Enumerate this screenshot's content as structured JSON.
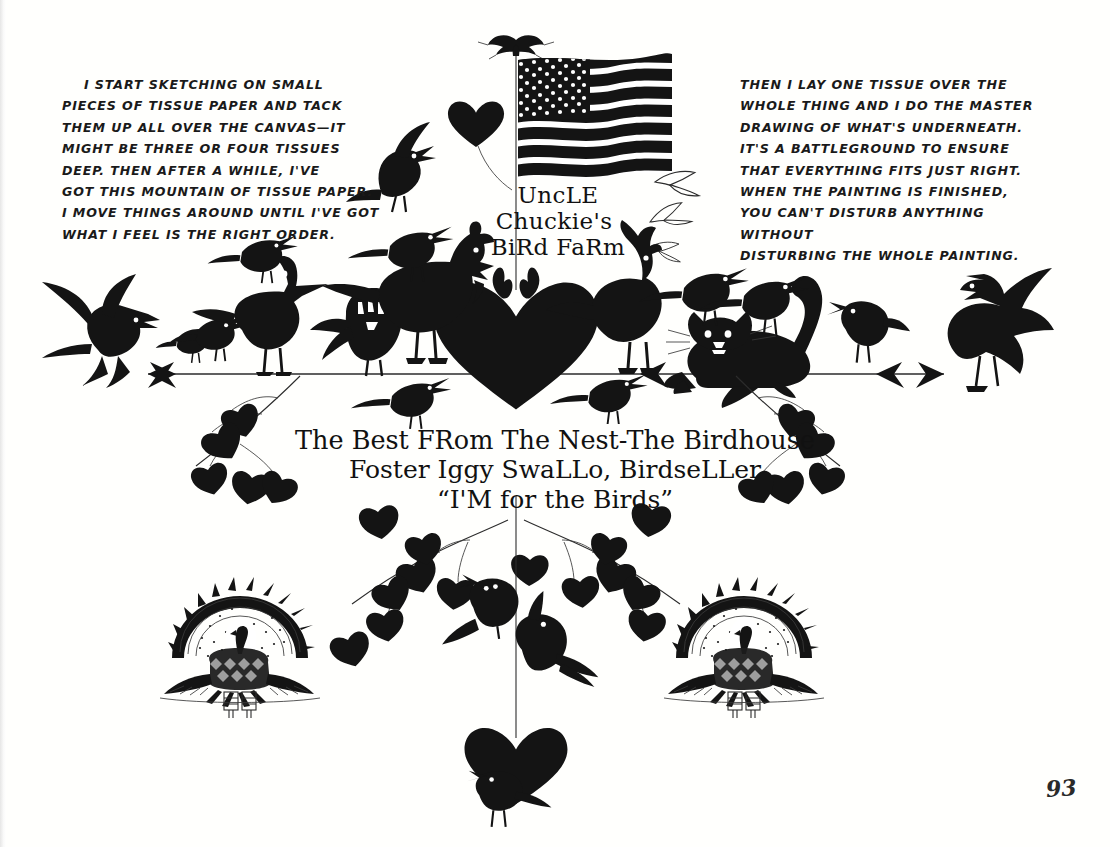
{
  "page": {
    "kind": "illustrated-book-page",
    "background_color": "#ffffff",
    "ink_color": "#141414",
    "page_number": "93"
  },
  "notes": {
    "left": "I START SKETCHING ON SMALL\nPIECES OF TISSUE PAPER AND TACK\nTHEM UP ALL OVER THE CANVAS—IT\nMIGHT BE THREE OR FOUR TISSUES\nDEEP. THEN AFTER A WHILE, I'VE\nGOT THIS MOUNTAIN OF TISSUE PAPER.\nI MOVE THINGS AROUND UNTIL I'VE GOT\nWHAT I FEEL IS THE RIGHT ORDER.",
    "right": "THEN I LAY ONE TISSUE OVER THE\nWHOLE THING AND I DO THE MASTER\nDRAWING OF WHAT'S UNDERNEATH.\nIT'S A BATTLEGROUND TO ENSURE\nTHAT EVERYTHING FITS JUST RIGHT.\nWHEN THE PAINTING IS FINISHED,\nYOU CAN'T DISTURB ANYTHING WITHOUT\nDISTURBING THE WHOLE PAINTING."
  },
  "sign_top": {
    "line1_lead": "U",
    "line1_rest": "NC",
    "line1_tail": "LE",
    "line1_plain": "UncLE",
    "line2": "Chuckie's",
    "line3": "BiRd FaRm"
  },
  "sign_bottom": {
    "line1": "The Best FRom The Nest-The Birdhouse",
    "line2": "Foster Iggy SwaLLo, BirdseLLer",
    "line3": "“I'M for the Birds”"
  },
  "artwork": {
    "flag": {
      "name": "american-flag",
      "finial": "eagle-finial",
      "stripes": 13,
      "star_rows": 9
    },
    "perch": {
      "name": "horizontal-perch-rail",
      "left_end": "arrow-fork",
      "right_end": "arrow-fork"
    },
    "hearts": [
      "large-center-heart",
      "lower-hanging-heart",
      "small-top-heart"
    ],
    "medallions": [
      "engraved-turkey-fan-left",
      "engraved-turkey-fan-right"
    ],
    "creatures": [
      "flying-crow-far-left",
      "small-bird-left",
      "perched-bird-left",
      "goose-duck",
      "bird-on-goose-back",
      "owl",
      "hen-with-comb",
      "bird-on-hen-back",
      "rooster",
      "black-cat",
      "bird-on-cat-head",
      "bird-on-cat-back",
      "singing-bird-right",
      "crow-with-spread-wings-far-right",
      "crow-upper-left-flying",
      "gull-upper-right-1",
      "gull-upper-right-2",
      "gull-upper-right-3",
      "bird-below-perch-left",
      "bird-below-perch-right",
      "bird-lower-center-left",
      "bird-lower-center-right",
      "bird-bottom"
    ],
    "vines": [
      "leafy-branch-upper-left",
      "leafy-branch-upper-right",
      "leafy-branch-lower-left",
      "leafy-branch-lower-right"
    ],
    "leaf_shape": "heart-leaf"
  }
}
